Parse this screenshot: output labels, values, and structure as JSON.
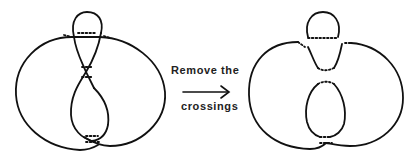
{
  "figure": {
    "left_panel": {
      "description": "knot diagram with crossings"
    },
    "right_panel": {
      "description": "diagram with crossings removed (smoothed)"
    },
    "arrow": {
      "label_top": "Remove the",
      "label_bottom": "crossings"
    },
    "colors": {
      "stroke": "#111111",
      "background": "#ffffff"
    }
  }
}
